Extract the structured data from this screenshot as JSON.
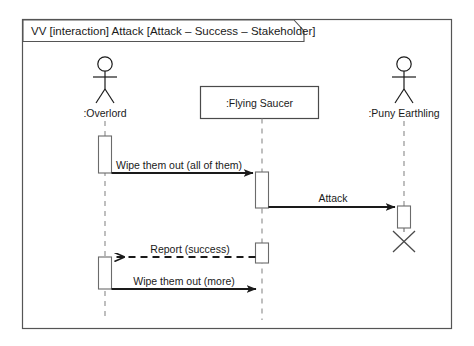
{
  "frame": {
    "title": "VV [interaction] Attack [Attack – Success – Stakeholder]",
    "border_color": "#555555",
    "background": "#ffffff"
  },
  "diagram": {
    "type": "uml-sequence-diagram",
    "line_color": "#1a1a1a",
    "lifeline_dash_color": "#8a8a8a",
    "participants": [
      {
        "id": "overlord",
        "label": ":Overlord",
        "shape": "actor",
        "x": 105
      },
      {
        "id": "flying-saucer",
        "label": ":Flying Saucer",
        "shape": "object-box",
        "x": 262
      },
      {
        "id": "puny-earthling",
        "label": ":Puny Earthling",
        "shape": "actor",
        "x": 404
      }
    ],
    "messages": [
      {
        "id": "msg-1",
        "label": "Wipe them out (all of them)",
        "from": "overlord",
        "to": "flying-saucer",
        "style": "solid",
        "arrow": "filled",
        "y": 173
      },
      {
        "id": "msg-2",
        "label": "Attack",
        "from": "flying-saucer",
        "to": "puny-earthling",
        "style": "solid",
        "arrow": "filled",
        "y": 207
      },
      {
        "id": "msg-3",
        "label": "Report (success)",
        "from": "flying-saucer",
        "to": "overlord",
        "style": "dashed",
        "arrow": "open",
        "y": 257
      },
      {
        "id": "msg-4",
        "label": "Wipe them out (more)",
        "from": "overlord",
        "to": "flying-saucer",
        "style": "solid",
        "arrow": "filled",
        "y": 289
      }
    ],
    "destruction_markers": [
      {
        "id": "earthling-destroyed",
        "participant": "puny-earthling",
        "x": 404,
        "y": 237
      }
    ]
  }
}
